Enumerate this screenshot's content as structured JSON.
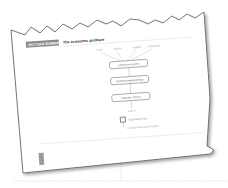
{
  "header": {
    "label": "SECTION SUMMARY",
    "title": "The economic problem"
  },
  "diagram": {
    "inputs": [
      "Land",
      "Labour",
      "Capital",
      "Enterprise"
    ],
    "boxes": [
      "Limited resources",
      "Unlimited wants/needs",
      "Scarcity / choice"
    ],
    "connector_label": "leads to",
    "checkbox_label": "Opportunity cost",
    "footnote": "next best alternative forgone"
  },
  "colors": {
    "header_bar": "#8a8a8a",
    "paper": "#ffffff",
    "edge": "#555555",
    "dots": "#bbbbbb",
    "tab": "#9a9a9a"
  }
}
